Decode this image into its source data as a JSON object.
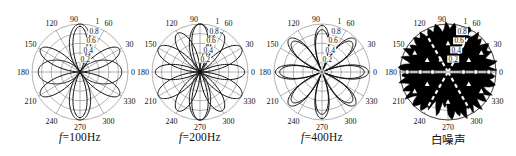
{
  "figure": {
    "background": "#ffffff",
    "ink": "#000000",
    "grid_color": "#666666",
    "curve_color": "#111111"
  },
  "captions": [
    {
      "f": "f",
      "rest": "=100Hz"
    },
    {
      "f": "f",
      "rest": "=200Hz"
    },
    {
      "f": "f",
      "rest": "=400Hz"
    },
    {
      "f": "",
      "rest": "白噪声"
    }
  ],
  "polar_grid": {
    "angle_ticks": [
      0,
      30,
      60,
      90,
      120,
      150,
      180,
      210,
      240,
      270,
      300,
      330
    ],
    "angle_labels": [
      "0",
      "30",
      "60",
      "90",
      "120",
      "150",
      "180",
      "210",
      "240",
      "270",
      "300",
      "330"
    ],
    "radial_ticks": [
      0.2,
      0.4,
      0.6,
      0.8,
      1
    ],
    "radial_labels": [
      "0.2",
      "0.4",
      "0.6",
      "0.8",
      "1"
    ],
    "radial_label_angle_deg": 72,
    "r_max": 1
  },
  "chart_data": [
    {
      "id": "100hz",
      "type": "polar-rose",
      "caption": "f=100Hz",
      "cx": 80,
      "curves": [
        {
          "trig": "sin",
          "k": 1,
          "exp": 7,
          "amp": 1.0
        },
        {
          "trig": "cos",
          "k": 1,
          "exp": 4,
          "amp": 0.87
        },
        {
          "trig": "sin",
          "k": 3,
          "exp": 1.5,
          "amp": 0.95
        }
      ]
    },
    {
      "id": "200hz",
      "type": "polar-rose",
      "caption": "f=200Hz",
      "cx": 200,
      "curves": [
        {
          "trig": "sin",
          "k": 3,
          "exp": 1.2,
          "amp": 1.0
        },
        {
          "trig": "cos",
          "k": 3,
          "exp": 1.2,
          "amp": 0.93
        },
        {
          "trig": "sin",
          "k": 1,
          "exp": 7,
          "amp": 1.0
        }
      ]
    },
    {
      "id": "400hz",
      "type": "polar-rose",
      "caption": "f=400Hz",
      "cx": 322,
      "curves": [
        {
          "trig": "cos",
          "k": 4,
          "exp": 0.8,
          "amp": 0.97
        },
        {
          "trig": "cos",
          "k": 4,
          "exp": 0.8,
          "amp": 0.88
        }
      ]
    },
    {
      "id": "white-noise",
      "type": "polar-noise",
      "caption": "白噪声",
      "cx": 448,
      "samples_deg_step": 5,
      "samples_r": [
        0.97,
        0.9,
        1.0,
        0.93,
        0.85,
        0.99,
        0.94,
        1.01,
        0.88,
        0.96,
        1.0,
        0.9,
        0.97,
        1.02,
        0.92,
        0.86,
        0.98,
        0.95,
        1.0,
        0.89,
        0.94,
        1.01,
        0.9,
        0.97,
        0.88,
        1.0,
        0.93,
        0.99,
        0.87,
        0.95,
        1.0,
        0.91,
        0.98,
        0.85,
        0.96,
        1.02,
        0.9,
        0.94,
        1.0,
        0.88,
        0.97,
        0.92,
        1.01,
        0.86,
        0.95,
        0.99,
        0.9,
        0.96,
        0.84,
        0.7,
        0.78,
        0.92,
        0.65,
        0.72,
        0.9,
        0.97,
        0.85,
        0.93,
        1.0,
        0.88,
        0.95,
        0.9,
        1.01,
        0.87,
        0.96,
        0.92,
        0.99,
        0.85,
        0.94,
        1.0,
        0.9,
        0.96
      ],
      "white_spoke_angles": [
        60,
        120,
        240,
        300
      ],
      "white_channel_angles": [
        0,
        180
      ],
      "ring_markers": [
        {
          "a": 0,
          "r": 0.32
        },
        {
          "a": 0,
          "r": 0.58
        },
        {
          "a": 0,
          "r": 0.85
        },
        {
          "a": 180,
          "r": 0.32
        },
        {
          "a": 180,
          "r": 0.58
        },
        {
          "a": 180,
          "r": 0.85
        }
      ],
      "white_marks": [
        {
          "a": 30,
          "r": 0.5
        },
        {
          "a": 30,
          "r": 0.8
        },
        {
          "a": 150,
          "r": 0.5
        },
        {
          "a": 150,
          "r": 0.8
        },
        {
          "a": 210,
          "r": 0.5
        },
        {
          "a": 210,
          "r": 0.8
        },
        {
          "a": 330,
          "r": 0.5
        },
        {
          "a": 330,
          "r": 0.8
        },
        {
          "a": 90,
          "r": 0.6
        },
        {
          "a": 270,
          "r": 0.62
        },
        {
          "a": 60,
          "r": 0.3
        },
        {
          "a": 120,
          "r": 0.3
        }
      ]
    }
  ]
}
